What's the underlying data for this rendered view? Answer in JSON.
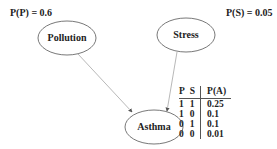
{
  "priors": {
    "pollution": "P(P) = 0.6",
    "stress": "P(S) = 0.05"
  },
  "nodes": {
    "pollution": "Pollution",
    "stress": "Stress",
    "asthma": "Asthma"
  },
  "cpt": {
    "headers": [
      "P",
      "S",
      "P(A)"
    ],
    "rows": [
      [
        "1",
        "1",
        "0.25"
      ],
      [
        "1",
        "0",
        "0.1"
      ],
      [
        "0",
        "1",
        "0.1"
      ],
      [
        "0",
        "0",
        "0.01"
      ]
    ]
  }
}
